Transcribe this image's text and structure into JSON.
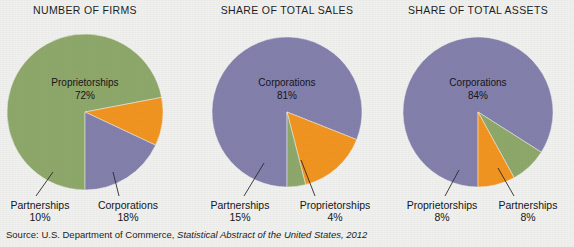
{
  "figure": {
    "background_color": "#f0f1ee",
    "source_prefix": "Source: U.S. Department of Commerce, ",
    "source_italic": "Statistical Abstract of the United States, 2012"
  },
  "palette": {
    "proprietorships": "#8fa86a",
    "partnerships": "#f29520",
    "corporations": "#8480ad"
  },
  "chart_data": [
    {
      "type": "pie",
      "title": "NUMBER OF FIRMS",
      "categories": [
        "Proprietorships",
        "Partnerships",
        "Corporations"
      ],
      "values": [
        72,
        10,
        18
      ],
      "value_labels": [
        "72%",
        "10%",
        "18%"
      ],
      "colors": [
        "#8fa86a",
        "#f29520",
        "#8480ad"
      ],
      "inside_label": {
        "name": "Proprietorships",
        "value": "72%"
      },
      "callouts": [
        {
          "name": "Partnerships",
          "value": "10%"
        },
        {
          "name": "Corporations",
          "value": "18%"
        }
      ]
    },
    {
      "type": "pie",
      "title": "SHARE OF TOTAL SALES",
      "categories": [
        "Corporations",
        "Partnerships",
        "Proprietorships"
      ],
      "values": [
        81,
        15,
        4
      ],
      "value_labels": [
        "81%",
        "15%",
        "4%"
      ],
      "colors": [
        "#8480ad",
        "#f29520",
        "#8fa86a"
      ],
      "inside_label": {
        "name": "Corporations",
        "value": "81%"
      },
      "callouts": [
        {
          "name": "Partnerships",
          "value": "15%"
        },
        {
          "name": "Proprietorships",
          "value": "4%"
        }
      ]
    },
    {
      "type": "pie",
      "title": "SHARE OF TOTAL ASSETS",
      "categories": [
        "Corporations",
        "Proprietorships",
        "Partnerships"
      ],
      "values": [
        84,
        8,
        8
      ],
      "value_labels": [
        "84%",
        "8%",
        "8%"
      ],
      "colors": [
        "#8480ad",
        "#8fa86a",
        "#f29520"
      ],
      "inside_label": {
        "name": "Corporations",
        "value": "84%"
      },
      "callouts": [
        {
          "name": "Proprietorships",
          "value": "8%"
        },
        {
          "name": "Partnerships",
          "value": "8%"
        }
      ]
    }
  ]
}
